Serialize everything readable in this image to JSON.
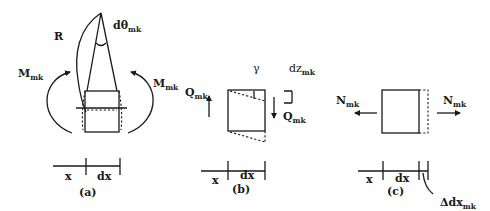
{
  "figure": {
    "panel_a": {
      "caption": "(a)",
      "radius_label": "R",
      "angle_label": "dθ",
      "angle_sub": "mk",
      "moment_left": "M",
      "moment_left_sub": "mk",
      "moment_right": "M",
      "moment_right_sub": "mk",
      "dim_x": "x",
      "dim_dx": "dx"
    },
    "panel_b": {
      "caption": "(b)",
      "shear_angle_label": "γ",
      "disp_label": "dz",
      "disp_sub": "mk",
      "shear_left": "Q",
      "shear_left_sub": "mk",
      "shear_right": "Q",
      "shear_right_sub": "mk",
      "dim_x": "x",
      "dim_dx": "dx"
    },
    "panel_c": {
      "caption": "(c)",
      "axial_left": "N",
      "axial_left_sub": "mk",
      "axial_right": "N",
      "axial_right_sub": "mk",
      "dim_x": "x",
      "dim_dx": "dx",
      "elongation_label": "Δdx",
      "elongation_sub": "mk"
    }
  }
}
